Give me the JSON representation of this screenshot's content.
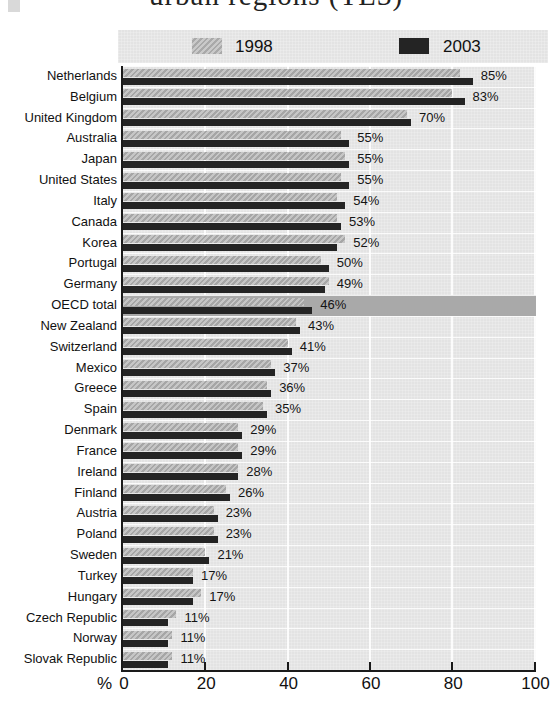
{
  "title": "urban regions (TL3)",
  "legend": {
    "items": [
      {
        "label": "1998",
        "swatch": "hatched-gray-swatch"
      },
      {
        "label": "2003",
        "swatch": "dark-swatch"
      }
    ]
  },
  "axis": {
    "unit_label": "%",
    "ticks": [
      0,
      20,
      40,
      60,
      80,
      100
    ]
  },
  "colors": {
    "plot_background": "#e3e3e3",
    "bar_1998": "#b0b0b0",
    "bar_2003": "#242424",
    "highlight_band": "#a9a9a9",
    "gridline": "#ffffff",
    "axis_line": "#1a1a1a"
  },
  "chart_data": {
    "type": "bar",
    "orientation": "horizontal",
    "title": "urban regions (TL3)",
    "xlabel": "%",
    "xlim": [
      0,
      100
    ],
    "grid": "vertical white gridlines every 20",
    "legend_position": "top",
    "highlight_category": "OECD total",
    "categories": [
      "Netherlands",
      "Belgium",
      "United Kingdom",
      "Australia",
      "Japan",
      "United States",
      "Italy",
      "Canada",
      "Korea",
      "Portugal",
      "Germany",
      "OECD total",
      "New Zealand",
      "Switzerland",
      "Mexico",
      "Greece",
      "Spain",
      "Denmark",
      "France",
      "Ireland",
      "Finland",
      "Austria",
      "Poland",
      "Sweden",
      "Turkey",
      "Hungary",
      "Czech Republic",
      "Norway",
      "Slovak Republic"
    ],
    "series": [
      {
        "name": "1998",
        "note": "unlabeled in chart; values estimated from bar lengths",
        "values": [
          82,
          80,
          69,
          53,
          54,
          53,
          52,
          52,
          54,
          48,
          50,
          44,
          42,
          40,
          36,
          35,
          34,
          28,
          28,
          28,
          25,
          22,
          22,
          20,
          17,
          19,
          13,
          12,
          12
        ]
      },
      {
        "name": "2003",
        "values": [
          85,
          83,
          70,
          55,
          55,
          55,
          54,
          53,
          52,
          50,
          49,
          46,
          43,
          41,
          37,
          36,
          35,
          29,
          29,
          28,
          26,
          23,
          23,
          21,
          17,
          17,
          11,
          11,
          11
        ]
      }
    ],
    "data_labels": [
      "85%",
      "83%",
      "70%",
      "55%",
      "55%",
      "55%",
      "54%",
      "53%",
      "52%",
      "50%",
      "49%",
      "46%",
      "43%",
      "41%",
      "37%",
      "36%",
      "35%",
      "29%",
      "29%",
      "28%",
      "26%",
      "23%",
      "23%",
      "21%",
      "17%",
      "17%",
      "11%",
      "11%",
      "11%"
    ]
  }
}
